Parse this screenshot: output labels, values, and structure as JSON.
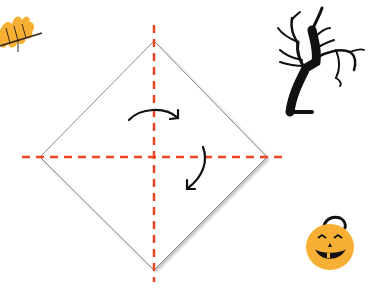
{
  "diagram": {
    "type": "origami-fold-instructions",
    "paper": {
      "shape": "diamond",
      "fill": "#ffffff",
      "stroke": "#6e6e6e",
      "points": {
        "top": [
          154,
          41
        ],
        "right": [
          267,
          157
        ],
        "bottom": [
          154,
          270
        ],
        "left": [
          40,
          157
        ]
      }
    },
    "fold_lines": {
      "color": "#ee4422",
      "style": "dashed",
      "vertical": {
        "x": 154,
        "y1": 25,
        "y2": 282
      },
      "horizontal": {
        "y": 157,
        "x1": 22,
        "x2": 286
      }
    },
    "arrows": [
      {
        "name": "fold-arrow-top",
        "direction": "clockwise-right"
      },
      {
        "name": "fold-arrow-right",
        "direction": "clockwise-down"
      }
    ],
    "decorations": [
      {
        "name": "autumn-leaf",
        "color": "#f7b033"
      },
      {
        "name": "spooky-tree",
        "color": "#111111"
      },
      {
        "name": "jack-o-lantern",
        "color": "#f7b033"
      }
    ]
  }
}
